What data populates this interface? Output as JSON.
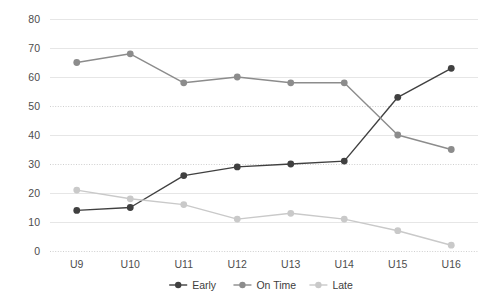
{
  "chart_data": {
    "type": "line",
    "title": "",
    "subtitle": "",
    "xlabel": "",
    "ylabel": "",
    "categories": [
      "U9",
      "U10",
      "U11",
      "U12",
      "U13",
      "U14",
      "U15",
      "U16"
    ],
    "ylim": [
      0,
      80
    ],
    "ytick_values": [
      0,
      10,
      20,
      30,
      40,
      50,
      60,
      70,
      80
    ],
    "ytick_labels": [
      "0",
      "10",
      "20",
      "30",
      "40",
      "50",
      "60",
      "70",
      "80"
    ],
    "grid": {
      "horizontal": true,
      "vertical": false,
      "style_solid_at": [
        80,
        70,
        60,
        40,
        20,
        10
      ],
      "style_dotted_at": [
        50,
        30,
        0
      ]
    },
    "legend": {
      "position": "bottom-center",
      "entries": [
        {
          "name": "Early",
          "color": "#404040",
          "marker": "circle"
        },
        {
          "name": "On Time",
          "color": "#8c8c8c",
          "marker": "circle"
        },
        {
          "name": "Late",
          "color": "#c9c9c9",
          "marker": "circle"
        }
      ]
    },
    "series": [
      {
        "name": "Early",
        "color": "#404040",
        "values": [
          14,
          15,
          26,
          29,
          30,
          31,
          53,
          63
        ]
      },
      {
        "name": "On Time",
        "color": "#8c8c8c",
        "values": [
          65,
          68,
          58,
          60,
          58,
          58,
          40,
          35
        ]
      },
      {
        "name": "Late",
        "color": "#c9c9c9",
        "values": [
          21,
          18,
          16,
          11,
          13,
          11,
          7,
          2
        ]
      }
    ]
  }
}
